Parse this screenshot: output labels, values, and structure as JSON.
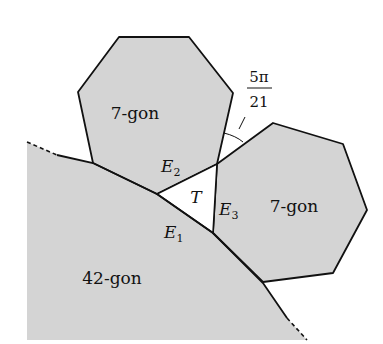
{
  "figure": {
    "polygons": [
      {
        "id": "big",
        "label": "42-gon"
      },
      {
        "id": "top",
        "label": "7-gon"
      },
      {
        "id": "right",
        "label": "7-gon"
      }
    ],
    "triangle_label": "T",
    "edges": [
      {
        "name": "E",
        "sub": "1"
      },
      {
        "name": "E",
        "sub": "2"
      },
      {
        "name": "E",
        "sub": "3"
      }
    ],
    "angle": {
      "numerator": "5π",
      "denominator": "21"
    },
    "colors": {
      "fill": "#d4d4d4",
      "stroke": "#111111",
      "background": "#ffffff"
    }
  }
}
